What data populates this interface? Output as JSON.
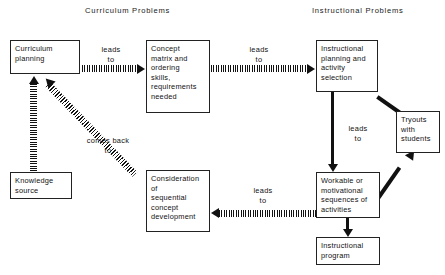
{
  "diagram": {
    "headings": {
      "left": "Curriculum  Problems",
      "right": "Instructional  Problems"
    },
    "nodes": {
      "curriculum_planning": {
        "lines": [
          "Curriculum",
          "planning"
        ]
      },
      "concept_matrix": {
        "lines": [
          "Concept",
          "matrix and",
          "ordering",
          "skills,",
          "requirements",
          "needed"
        ]
      },
      "instructional_planning": {
        "lines": [
          "Instructional",
          "planning and",
          "activity",
          "selection"
        ]
      },
      "tryouts": {
        "lines": [
          "Tryouts",
          "with",
          "students"
        ]
      },
      "knowledge_source": {
        "lines": [
          "Knowledge",
          "source"
        ]
      },
      "consideration": {
        "lines": [
          "Consideration",
          "of",
          "sequential",
          "concept",
          "development"
        ]
      },
      "workable": {
        "lines": [
          "Workable  or",
          "motivational",
          "sequences of",
          "activities"
        ]
      },
      "instructional_program": {
        "lines": [
          "Instructional",
          "program"
        ]
      }
    },
    "edge_labels": {
      "planning_to_concept": {
        "line1": "leads",
        "line2": "to"
      },
      "concept_to_instructional": {
        "line1": "leads",
        "line2": "to"
      },
      "instructional_to_workable": {
        "line1": "leads",
        "line2": "to"
      },
      "workable_to_consideration": {
        "line1": "leads",
        "line2": "to"
      },
      "consideration_to_planning": {
        "line1": "comes  back",
        "line2": "to"
      }
    },
    "colors": {
      "stroke": "#111111",
      "background": "#ffffff",
      "text": "#111111"
    }
  }
}
